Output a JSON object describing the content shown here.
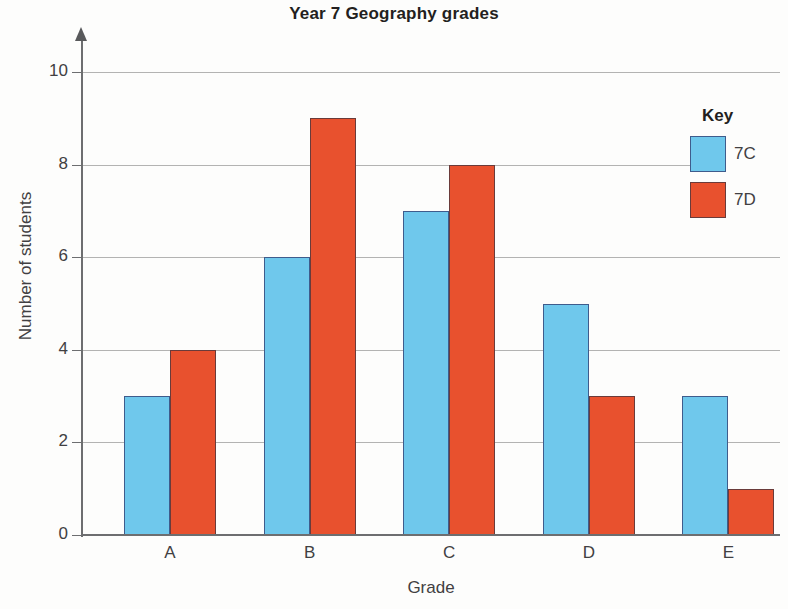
{
  "chart_data": {
    "type": "bar",
    "title": "Year 7 Geography grades",
    "xlabel": "Grade",
    "ylabel": "Number of students",
    "categories": [
      "A",
      "B",
      "C",
      "D",
      "E"
    ],
    "series": [
      {
        "name": "7C",
        "color": "#6fc8ec",
        "values": [
          3,
          6,
          7,
          5,
          3
        ]
      },
      {
        "name": "7D",
        "color": "#e8512e",
        "values": [
          4,
          9,
          8,
          3,
          1
        ]
      }
    ],
    "ylim": [
      0,
      10
    ],
    "yticks": [
      0,
      2,
      4,
      6,
      8,
      10
    ],
    "ytick_labels": [
      "0",
      "2",
      "4",
      "6",
      "8",
      "10"
    ],
    "grid": true,
    "legend": {
      "title": "Key",
      "position": "right",
      "entries": [
        {
          "label": "7C",
          "color": "#6fc8ec"
        },
        {
          "label": "7D",
          "color": "#e8512e"
        }
      ]
    }
  }
}
